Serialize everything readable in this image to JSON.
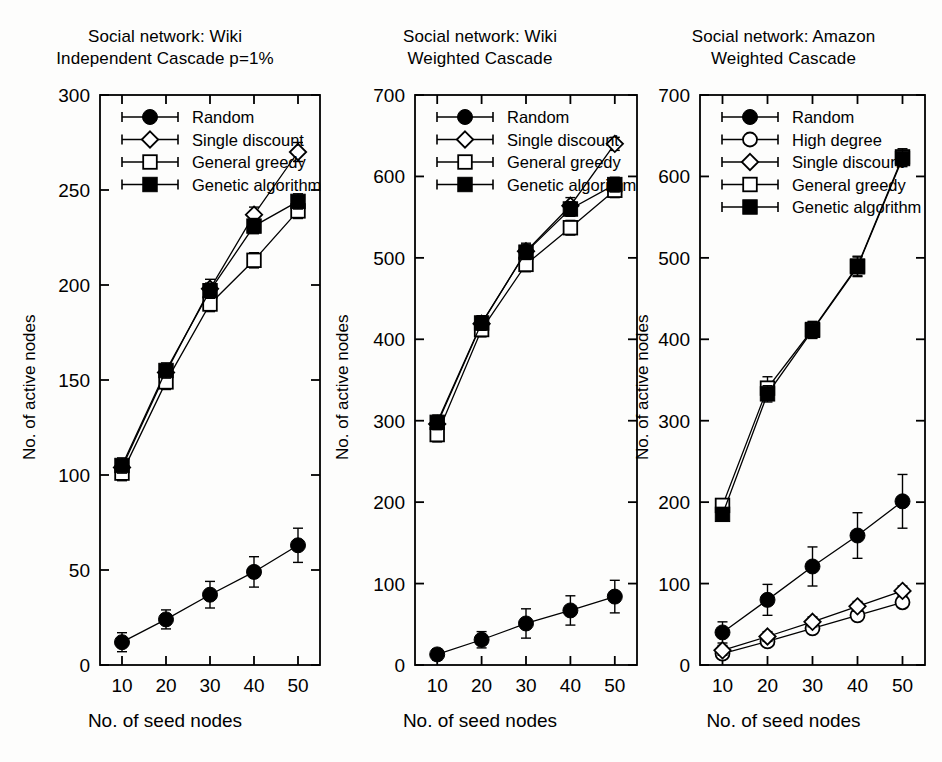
{
  "figure": {
    "background_color": "#fdfdfc",
    "ink_color": "#000000",
    "xlabel": "No. of seed nodes",
    "ylabel": "No. of active nodes"
  },
  "panels": [
    {
      "id": "panel-wiki-ic",
      "title_line1": "Social network: Wiki",
      "title_line2": "Independent Cascade p=1%",
      "xlabel": "No. of seed nodes",
      "ylabel": "No. of active nodes"
    },
    {
      "id": "panel-wiki-wc",
      "title_line1": "Social network: Wiki",
      "title_line2": "Weighted Cascade",
      "xlabel": "No. of seed nodes",
      "ylabel": "No. of active nodes"
    },
    {
      "id": "panel-amazon-wc",
      "title_line1": "Social network: Amazon",
      "title_line2": "Weighted Cascade",
      "xlabel": "No. of seed nodes",
      "ylabel": "No. of active nodes"
    }
  ],
  "chart_data": [
    {
      "type": "line",
      "id": "panel-wiki-ic",
      "title": "Social network: Wiki\nIndependent Cascade p=1%",
      "xlabel": "No. of seed nodes",
      "ylabel": "No. of active nodes",
      "x": [
        10,
        20,
        30,
        40,
        50
      ],
      "xlim": [
        5,
        55
      ],
      "ylim": [
        0,
        300
      ],
      "xticks": [
        10,
        20,
        30,
        40,
        50
      ],
      "yticks": [
        0,
        50,
        100,
        150,
        200,
        250,
        300
      ],
      "grid": false,
      "legend_position": "top-left",
      "series": [
        {
          "name": "Random",
          "marker": "filled-circle",
          "values": [
            12,
            24,
            37,
            49,
            63
          ],
          "errors": [
            5,
            5,
            7,
            8,
            9
          ]
        },
        {
          "name": "Single discount",
          "marker": "open-diamond",
          "values": [
            104,
            154,
            198,
            237,
            270
          ],
          "errors": [
            4,
            4,
            5,
            4,
            5
          ]
        },
        {
          "name": "General greedy",
          "marker": "open-square",
          "values": [
            101,
            149,
            190,
            213,
            239
          ],
          "errors": [
            4,
            4,
            4,
            4,
            4
          ]
        },
        {
          "name": "Genetic algorithm",
          "marker": "filled-square",
          "values": [
            105,
            155,
            197,
            231,
            244
          ],
          "errors": [
            4,
            4,
            4,
            4,
            4
          ]
        }
      ]
    },
    {
      "type": "line",
      "id": "panel-wiki-wc",
      "title": "Social network: Wiki\nWeighted Cascade",
      "xlabel": "No. of seed nodes",
      "ylabel": "No. of active nodes",
      "x": [
        10,
        20,
        30,
        40,
        50
      ],
      "xlim": [
        5,
        55
      ],
      "ylim": [
        0,
        700
      ],
      "xticks": [
        10,
        20,
        30,
        40,
        50
      ],
      "yticks": [
        0,
        100,
        200,
        300,
        400,
        500,
        600,
        700
      ],
      "grid": false,
      "legend_position": "top-left",
      "series": [
        {
          "name": "Random",
          "marker": "filled-circle",
          "values": [
            13,
            31,
            51,
            67,
            84
          ],
          "errors": [
            7,
            10,
            18,
            18,
            20
          ]
        },
        {
          "name": "Single discount",
          "marker": "open-diamond",
          "values": [
            296,
            419,
            508,
            564,
            640
          ],
          "errors": [
            10,
            10,
            10,
            10,
            8
          ]
        },
        {
          "name": "General greedy",
          "marker": "open-square",
          "values": [
            283,
            412,
            492,
            537,
            583
          ],
          "errors": [
            9,
            9,
            9,
            9,
            9
          ]
        },
        {
          "name": "Genetic algorithm",
          "marker": "filled-square",
          "values": [
            298,
            420,
            507,
            560,
            590
          ],
          "errors": [
            9,
            9,
            9,
            9,
            9
          ]
        }
      ]
    },
    {
      "type": "line",
      "id": "panel-amazon-wc",
      "title": "Social network: Amazon\nWeighted Cascade",
      "xlabel": "No. of seed nodes",
      "ylabel": "No. of active nodes",
      "x": [
        10,
        20,
        30,
        40,
        50
      ],
      "xlim": [
        5,
        55
      ],
      "ylim": [
        0,
        700
      ],
      "xticks": [
        10,
        20,
        30,
        40,
        50
      ],
      "yticks": [
        0,
        100,
        200,
        300,
        400,
        500,
        600,
        700
      ],
      "grid": false,
      "legend_position": "top-left",
      "series": [
        {
          "name": "Random",
          "marker": "filled-circle",
          "values": [
            40,
            80,
            121,
            159,
            201
          ],
          "errors": [
            13,
            19,
            24,
            28,
            33
          ]
        },
        {
          "name": "High degree",
          "marker": "open-circle",
          "values": [
            14,
            29,
            45,
            61,
            77
          ],
          "errors": [
            6,
            6,
            6,
            6,
            6
          ]
        },
        {
          "name": "Single discount",
          "marker": "open-diamond",
          "values": [
            18,
            35,
            53,
            72,
            91
          ],
          "errors": [
            6,
            6,
            6,
            6,
            6
          ]
        },
        {
          "name": "General greedy",
          "marker": "open-square",
          "values": [
            196,
            340,
            412,
            490,
            624
          ],
          "errors": [
            8,
            14,
            10,
            12,
            10
          ]
        },
        {
          "name": "Genetic algorithm",
          "marker": "filled-square",
          "values": [
            185,
            333,
            411,
            489,
            622
          ],
          "errors": [
            8,
            10,
            10,
            12,
            10
          ]
        }
      ]
    }
  ]
}
